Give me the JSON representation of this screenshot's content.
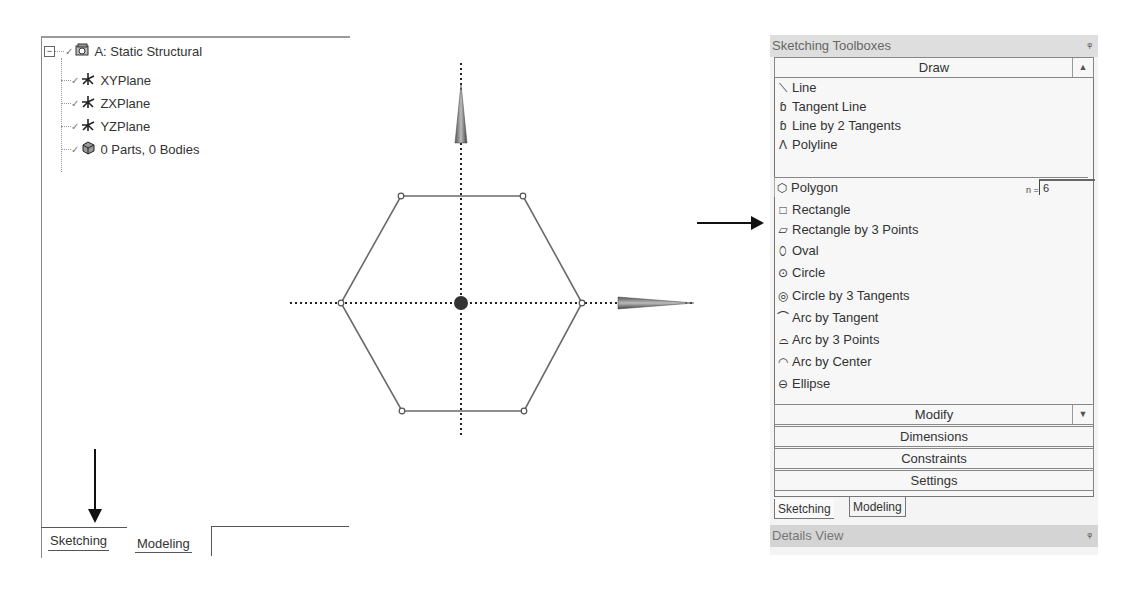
{
  "tree": {
    "root": {
      "label": "A: Static Structural",
      "icon": "static-structural-icon",
      "expanded": true
    },
    "children": [
      {
        "label": "XYPlane",
        "icon": "plane-axis-icon"
      },
      {
        "label": "ZXPlane",
        "icon": "plane-axis-icon"
      },
      {
        "label": "YZPlane",
        "icon": "plane-axis-icon"
      },
      {
        "label": "0 Parts, 0 Bodies",
        "icon": "parts-bodies-icon"
      }
    ],
    "expander_symbol": "−",
    "check_symbol": "✓"
  },
  "left_tabs": [
    {
      "label": "Sketching",
      "active": true
    },
    {
      "label": "Modeling",
      "active": false
    }
  ],
  "sketch": {
    "shape": "hexagon",
    "sides": 6,
    "vertices": [
      [
        401,
        196
      ],
      [
        523,
        196
      ],
      [
        582,
        303
      ],
      [
        524,
        411
      ],
      [
        402,
        411
      ],
      [
        341,
        303
      ]
    ],
    "center": [
      461,
      303
    ],
    "line_color": "#6a6a6a",
    "axis_color": "#222222"
  },
  "toolbox": {
    "title": "Sketching Toolboxes",
    "pin_symbol": "ᵠ",
    "draw_group": {
      "label": "Draw",
      "collapse_symbol": "▲",
      "items": [
        {
          "label": "Line",
          "icon": "line-icon",
          "glyph": "⟍"
        },
        {
          "label": "Tangent Line",
          "icon": "tangent-line-icon",
          "glyph": "ɓ"
        },
        {
          "label": "Line by 2 Tangents",
          "icon": "line-by-2-tangents-icon",
          "glyph": "ɓ"
        },
        {
          "label": "Polyline",
          "icon": "polyline-icon",
          "glyph": "Λ"
        },
        {
          "label": "Polygon",
          "icon": "polygon-icon",
          "glyph": "⬡",
          "selected": true
        },
        {
          "label": "Rectangle",
          "icon": "rectangle-icon",
          "glyph": "□"
        },
        {
          "label": "Rectangle by 3 Points",
          "icon": "rectangle-3-points-icon",
          "glyph": "▱"
        },
        {
          "label": "Oval",
          "icon": "oval-icon",
          "glyph": "⬯"
        },
        {
          "label": "Circle",
          "icon": "circle-icon",
          "glyph": "⊙"
        },
        {
          "label": "Circle by 3 Tangents",
          "icon": "circle-3-tangents-icon",
          "glyph": "◎"
        },
        {
          "label": "Arc by Tangent",
          "icon": "arc-by-tangent-icon",
          "glyph": "⌒"
        },
        {
          "label": "Arc by 3 Points",
          "icon": "arc-3-points-icon",
          "glyph": "⌓"
        },
        {
          "label": "Arc by Center",
          "icon": "arc-by-center-icon",
          "glyph": "◠"
        },
        {
          "label": "Ellipse",
          "icon": "ellipse-icon",
          "glyph": "⊖"
        }
      ],
      "polygon_param": {
        "label": "n =",
        "value": "6"
      }
    },
    "other_groups": [
      {
        "label": "Modify",
        "expand_symbol": "▼"
      },
      {
        "label": "Dimensions"
      },
      {
        "label": "Constraints"
      },
      {
        "label": "Settings"
      }
    ],
    "tabs": [
      {
        "label": "Sketching",
        "active": true
      },
      {
        "label": "Modeling",
        "active": false
      }
    ]
  },
  "details_view": {
    "title": "Details View",
    "pin_symbol": "ᵠ"
  }
}
